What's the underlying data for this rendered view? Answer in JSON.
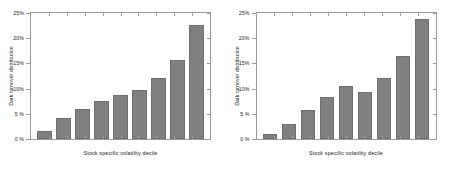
{
  "figure": {
    "background_color": "#ffffff",
    "bar_color": "#808080",
    "axis_color": "#9a9a9a",
    "text_color": "#1a1a1a"
  },
  "chart_data": [
    {
      "type": "bar",
      "panel": "left",
      "title": "",
      "xlabel": "Stock specific volatility decile",
      "ylabel": "Dark turnover distribution",
      "categories": [
        "1",
        "2",
        "3",
        "4",
        "5",
        "6",
        "7",
        "8",
        "9"
      ],
      "values": [
        1.6,
        4.1,
        5.9,
        7.6,
        8.8,
        9.8,
        12.1,
        15.6,
        22.7
      ],
      "ylim": [
        0,
        25
      ],
      "yticks": [
        0,
        5,
        10,
        15,
        20,
        25
      ],
      "ytick_labels": [
        "0 %",
        "5 %",
        "10%",
        "15%",
        "20%",
        "25%"
      ],
      "xtick_labels": [],
      "grid": false,
      "legend": null
    },
    {
      "type": "bar",
      "panel": "right",
      "title": "",
      "xlabel": "Stock specific volatility decile",
      "ylabel": "Dark turnover distribution",
      "categories": [
        "1",
        "2",
        "3",
        "4",
        "5",
        "6",
        "7",
        "8",
        "9"
      ],
      "values": [
        0.9,
        3.0,
        5.7,
        8.4,
        10.5,
        9.4,
        12.1,
        16.4,
        23.8
      ],
      "ylim": [
        0,
        25
      ],
      "yticks": [
        0,
        5,
        10,
        15,
        20,
        25
      ],
      "ytick_labels": [
        "0 %",
        "5 %",
        "10%",
        "15%",
        "20%",
        "25%"
      ],
      "xtick_labels": [],
      "grid": false,
      "legend": null
    }
  ]
}
